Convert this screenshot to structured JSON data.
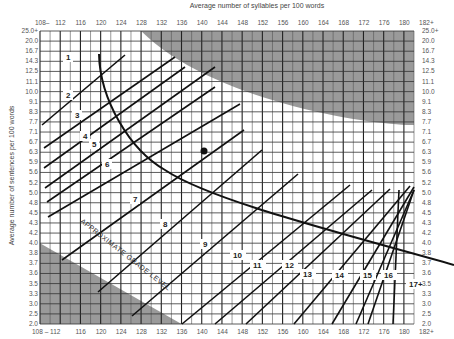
{
  "chart_data": {
    "type": "line",
    "xlabel": "Average number of syllables per 100 words",
    "ylabel": "Average number of sentences per 100 words",
    "x_ticks": [
      "108–",
      "112",
      "116",
      "120",
      "124",
      "128",
      "132",
      "136",
      "140",
      "144",
      "148",
      "152",
      "156",
      "160",
      "164",
      "168",
      "172",
      "176",
      "180",
      "182+"
    ],
    "x_ticks_bottom": [
      "108 – 112",
      "116",
      "120",
      "124",
      "128",
      "132",
      "136",
      "140",
      "144",
      "148",
      "152",
      "156",
      "160",
      "164",
      "168",
      "172",
      "176",
      "180",
      "182+"
    ],
    "y_ticks": [
      "25.0+",
      "20.0",
      "16.7",
      "14.3",
      "12.5",
      "11.1",
      "10.0",
      "9.1",
      "8.3",
      "7.7",
      "7.1",
      "6.7",
      "6.3",
      "5.9",
      "5.6",
      "5.2",
      "5.0",
      "4.8",
      "4.5",
      "4.3",
      "4.2",
      "4.0",
      "3.8",
      "3.7",
      "3.6",
      "3.5",
      "3.3",
      "3.0",
      "2.5",
      "2.0"
    ],
    "grade_levels": [
      "1",
      "2",
      "3",
      "4",
      "5",
      "6",
      "7",
      "8",
      "9",
      "10",
      "11",
      "12",
      "13",
      "14",
      "15",
      "16",
      "17+"
    ],
    "annotation": "APPROXIMATE GRADE LEVEL",
    "plotted_point": {
      "syllables": 141,
      "sentences": 6.3
    },
    "invalid_regions": [
      "upper-right shaded",
      "lower-left shaded"
    ],
    "grid": true,
    "xlim": [
      108,
      182
    ],
    "ylim": [
      2.0,
      25.0
    ]
  },
  "labels": {
    "top_title": "Average number of syllables per 100 words",
    "side_title": "Average number of sentences per 100 words",
    "approx": "APPROXIMATE GRADE LEVEL"
  }
}
